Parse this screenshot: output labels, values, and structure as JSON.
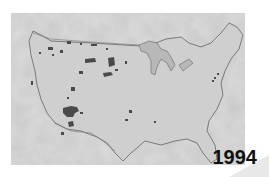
{
  "map": {
    "title": "Contiguous United States",
    "year_label": "1994",
    "colors": {
      "land": "#cfcfcf",
      "ocean_texture_light": "#e6e6e6",
      "ocean_texture_dark": "#9a9a9a",
      "highlight_regions": "#4a4a4a",
      "border_lines": "#555555",
      "label": "#111111"
    },
    "regions_highlighted": "dark gray patches scattered across the western and central states"
  }
}
